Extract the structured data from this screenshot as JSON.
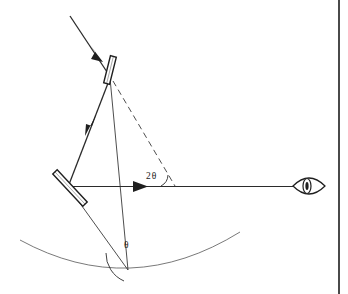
{
  "figure": {
    "domain": "diagram",
    "background_color": "#ffffff",
    "line_color": "#2b2b2b",
    "thin_line_color": "#555555",
    "canvas": {
      "width": 348,
      "height": 294
    }
  },
  "labels": {
    "angle_double": "2θ",
    "angle_single": "θ"
  },
  "elements": {
    "incident_ray_name": "incident-ray",
    "reflected_ray_name": "reflected-ray",
    "observation_ray_name": "observation-ray",
    "upper_mirror_name": "upper-mirror",
    "lower_mirror_name": "lower-mirror",
    "dashed_reference_name": "dashed-reference-line",
    "graduated_arc_name": "graduated-arc",
    "eye_name": "observer-eye",
    "page_edge_name": "page-edge"
  },
  "geometry": {
    "incident_ray": {
      "x1": 70,
      "y1": 16,
      "x2": 112,
      "y2": 79
    },
    "incident_arrow_at": {
      "x": 97,
      "y": 55
    },
    "reflected_ray": {
      "x1": 110,
      "y1": 78,
      "x2": 68,
      "y2": 186
    },
    "reflected_arrow_at": {
      "x": 91,
      "y": 128
    },
    "observation_ray": {
      "x1": 68,
      "y1": 186,
      "x2": 300,
      "y2": 186
    },
    "observation_arrow_at": {
      "x": 144,
      "y": 186
    },
    "upper_mirror": {
      "cx": 109,
      "cy": 70,
      "length": 26,
      "thickness": 5,
      "angle_deg": 70
    },
    "lower_mirror": {
      "cx": 70,
      "cy": 190,
      "length": 40,
      "thickness": 5,
      "angle_deg": 55
    },
    "dashed_line": {
      "x1": 112,
      "y1": 80,
      "x2": 174,
      "y2": 186
    },
    "vertex_lower": {
      "x": 128,
      "y": 270
    },
    "line_vertex_to_upper": {
      "x1": 128,
      "y1": 270,
      "x2": 110,
      "y2": 78
    },
    "line_vertex_to_lower_mirror": {
      "x1": 128,
      "y1": 270,
      "x2": 58,
      "y2": 172
    },
    "arc_2theta": {
      "cx": 174,
      "cy": 186,
      "radius": 13
    },
    "arc_theta": {
      "cx": 128,
      "cy": 270,
      "radius": 28
    },
    "graduated_arc": {
      "x_start": 20,
      "y_start": 240,
      "x_end": 240,
      "y_end": 232,
      "sag": 38
    },
    "eye": {
      "cx": 309,
      "cy": 186,
      "half_width": 16,
      "half_height": 12
    },
    "page_edge_x": 338
  }
}
